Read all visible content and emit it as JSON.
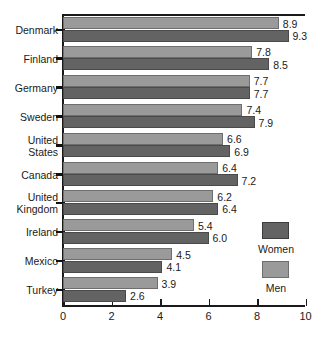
{
  "chart_data": {
    "type": "bar",
    "orientation": "horizontal",
    "title": "",
    "xlabel": "",
    "ylabel": "",
    "xlim": [
      0,
      10
    ],
    "xticks": [
      0,
      2,
      4,
      6,
      8,
      10
    ],
    "xtick_labels": [
      "0",
      "2",
      "4",
      "6",
      "8",
      "10"
    ],
    "grid": false,
    "legend_position": "right",
    "categories": [
      "Denmark",
      "Finland",
      "Germany",
      "Sweden",
      "United\nStates",
      "Canada",
      "United\nKingdom",
      "Ireland",
      "Mexico",
      "Turkey"
    ],
    "series": [
      {
        "name": "Men",
        "color": "#9a9a9a",
        "values": [
          8.9,
          7.8,
          7.7,
          7.4,
          6.6,
          6.4,
          6.2,
          5.4,
          4.5,
          3.9
        ],
        "value_labels": [
          "8.9",
          "7.8",
          "7.7",
          "7.4",
          "6.6",
          "6.4",
          "6.2",
          "5.4",
          "4.5",
          "3.9"
        ]
      },
      {
        "name": "Women",
        "color": "#636363",
        "values": [
          9.3,
          8.5,
          7.7,
          7.9,
          6.9,
          7.2,
          6.4,
          6.0,
          4.1,
          2.6
        ],
        "value_labels": [
          "9.3",
          "8.5",
          "7.7",
          "7.9",
          "6.9",
          "7.2",
          "6.4",
          "6.0",
          "4.1",
          "2.6"
        ]
      }
    ]
  },
  "legend": {
    "women_label": "Women",
    "men_label": "Men"
  }
}
